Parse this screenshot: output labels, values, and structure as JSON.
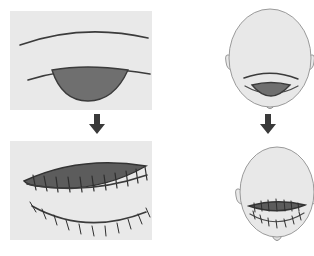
{
  "figure": {
    "background_color": "#ffffff",
    "panel_fill": "#e9e9e9",
    "skin_fill": "#e8e8e8",
    "skin_outline": "#9a9a9a",
    "line_color": "#3b3b3b",
    "eye_fill": "#6f6f6f",
    "eye_fill_sutured": "#5c5c5c",
    "arrow_color": "#3a3a3a"
  },
  "panels": [
    {
      "id": "closeup-before",
      "label": "Eyelid close-up before suturing",
      "position": "top-left",
      "x": 10,
      "y": 11,
      "width": 142,
      "height": 99,
      "features": [
        {
          "name": "upper-brow-crease",
          "type": "curve"
        },
        {
          "name": "upper-lid-margin",
          "type": "curve"
        },
        {
          "name": "open-wound-lens",
          "type": "filled-lens",
          "fill": "#6f6f6f"
        }
      ]
    },
    {
      "id": "closeup-after",
      "label": "Eyelid close-up after suturing",
      "position": "bottom-left",
      "x": 10,
      "y": 141,
      "width": 142,
      "height": 99,
      "features": [
        {
          "name": "sutured-lens-wound",
          "type": "filled-lens",
          "fill": "#5c5c5c"
        },
        {
          "name": "upper-suture-line",
          "type": "suture-row",
          "stitch_count": 13
        },
        {
          "name": "lower-suture-line",
          "type": "suture-row",
          "stitch_count": 13
        }
      ]
    },
    {
      "id": "face-before",
      "label": "Frontal face view before suturing",
      "position": "top-right",
      "x": 228,
      "y": 8,
      "width": 84,
      "height": 104,
      "features": [
        {
          "name": "head-oval",
          "type": "oval"
        },
        {
          "name": "left-ear",
          "type": "ear"
        },
        {
          "name": "right-ear",
          "type": "ear"
        },
        {
          "name": "eyebrow",
          "type": "curve"
        },
        {
          "name": "eye-open-wound",
          "type": "filled-lens",
          "fill": "#6f6f6f"
        },
        {
          "name": "lower-lid",
          "type": "curve"
        },
        {
          "name": "chin",
          "type": "chin"
        }
      ]
    },
    {
      "id": "face-after",
      "label": "Frontal face view after suturing",
      "position": "bottom-right",
      "x": 240,
      "y": 140,
      "width": 74,
      "height": 112,
      "features": [
        {
          "name": "head-oval",
          "type": "oval"
        },
        {
          "name": "left-ear",
          "type": "ear"
        },
        {
          "name": "right-ear",
          "type": "ear"
        },
        {
          "name": "sutured-eye-wound",
          "type": "filled-lens",
          "fill": "#5c5c5c"
        },
        {
          "name": "lower-suture-line",
          "type": "suture-row",
          "stitch_count": 12
        },
        {
          "name": "chin",
          "type": "chin"
        }
      ]
    }
  ],
  "arrows": [
    {
      "id": "arrow-left",
      "direction": "down",
      "x": 97,
      "y": 114,
      "label": "progresses to"
    },
    {
      "id": "arrow-right",
      "direction": "down",
      "x": 268,
      "y": 114,
      "label": "progresses to"
    }
  ]
}
